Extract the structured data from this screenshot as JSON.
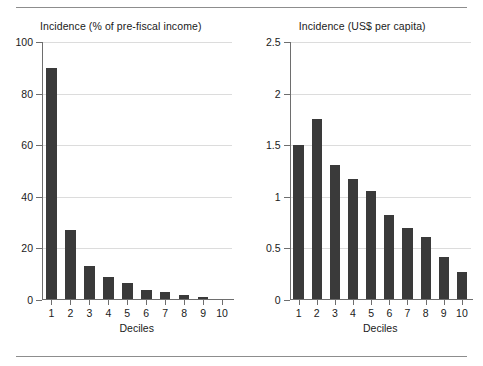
{
  "figure": {
    "background": "#ffffff",
    "bar_color": "#3a3a3a",
    "grid_color": "#dcdcdc",
    "axis_color": "#6e6e6e",
    "rule_color": "#8d8d8d"
  },
  "chart_data": [
    {
      "type": "bar",
      "title": "Incidence (% of pre-fiscal income)",
      "xlabel": "Deciles",
      "ylabel": "",
      "categories": [
        "1",
        "2",
        "3",
        "4",
        "5",
        "6",
        "7",
        "8",
        "9",
        "10"
      ],
      "values": [
        90,
        27,
        13,
        9,
        6.5,
        4,
        3,
        2,
        1,
        0.5
      ],
      "ylim": [
        0,
        100
      ],
      "yticks": [
        0,
        20,
        40,
        60,
        80,
        100
      ],
      "ytick_labels": [
        "0",
        "20",
        "40",
        "60",
        "80",
        "100"
      ],
      "grid": "horizontal",
      "legend": "none"
    },
    {
      "type": "bar",
      "title": "Incidence (US$ per capita)",
      "xlabel": "Deciles",
      "ylabel": "",
      "categories": [
        "1",
        "2",
        "3",
        "4",
        "5",
        "6",
        "7",
        "8",
        "9",
        "10"
      ],
      "values": [
        1.5,
        1.75,
        1.31,
        1.17,
        1.06,
        0.82,
        0.7,
        0.61,
        0.42,
        0.27
      ],
      "ylim": [
        0,
        2.5
      ],
      "yticks": [
        0,
        0.5,
        1,
        1.5,
        2,
        2.5
      ],
      "ytick_labels": [
        "0",
        "0.5",
        "1",
        "1.5",
        "2",
        "2.5"
      ],
      "grid": "horizontal",
      "legend": "none"
    }
  ]
}
